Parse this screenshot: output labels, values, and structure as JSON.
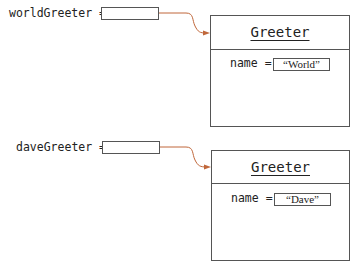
{
  "diagram": {
    "references": [
      {
        "variable": "worldGreeter",
        "equals": "="
      },
      {
        "variable": "daveGreeter",
        "equals": "="
      }
    ],
    "objects": [
      {
        "class_name": "Greeter",
        "field_name": "name",
        "equals": "=",
        "field_value": "“World”"
      },
      {
        "class_name": "Greeter",
        "field_name": "name",
        "equals": "=",
        "field_value": "“Dave”"
      }
    ],
    "colors": {
      "arrow": "#c0673a",
      "border": "#555555",
      "text": "#222222"
    }
  }
}
